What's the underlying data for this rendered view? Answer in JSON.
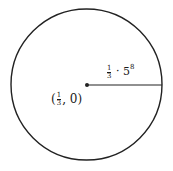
{
  "diagram": {
    "type": "circle",
    "center": {
      "x": 86.5,
      "y": 84.5
    },
    "radius_px": 76,
    "stroke_color": "#222222",
    "labels": {
      "radius": {
        "frac_num": "1",
        "frac_den": "3",
        "dot": "·",
        "base": "5",
        "exponent": "8",
        "full_text": "1/3 · 5^8"
      },
      "center": {
        "open": "(",
        "frac_num": "1",
        "frac_den": "3",
        "rest": ", 0)",
        "full_text": "(1/3, 0)"
      }
    }
  }
}
